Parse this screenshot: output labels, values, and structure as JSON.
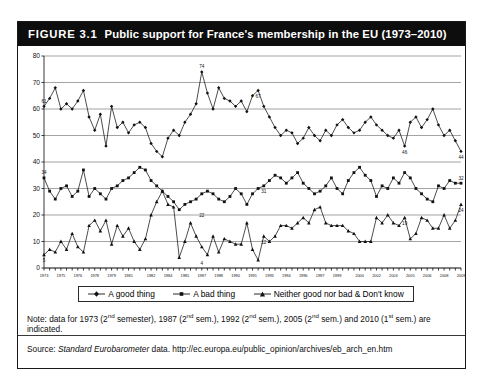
{
  "figure": {
    "number": "FIGURE 3.1",
    "title": "Public support for France's membership in the EU (1973–2010)"
  },
  "note": {
    "prefix": "Note: data for 1973 (2",
    "full": "Note: data for 1973 (2nd semester), 1987 (2nd sem.), 1992 (2nd sem.), 2005 (2nd sem.) and 2010 (1st sem.) are indicated."
  },
  "source": {
    "label": "Source:",
    "italic": "Standard Eurobarometer",
    "rest": "data.",
    "url": "http://ec.europa.eu/public_opinion/archives/eb_arch_en.htm"
  },
  "legend": {
    "items": [
      {
        "label": "A good thing",
        "marker": "line-diamond"
      },
      {
        "label": "A bad thing",
        "marker": "line-square"
      },
      {
        "label": "Neither good nor bad & Don't know",
        "marker": "line-triangle"
      }
    ]
  },
  "chart_data": {
    "type": "line",
    "title": "Public support for France's membership in the EU (1973–2010)",
    "xlabel": "",
    "ylabel": "",
    "ylim": [
      0,
      80
    ],
    "yticks": [
      0,
      10,
      20,
      30,
      40,
      50,
      60,
      70,
      80
    ],
    "grid": true,
    "legend_position": "bottom",
    "x_tick_labels": [
      "1973",
      "1975",
      "1976",
      "1978",
      "1979",
      "1981",
      "1982",
      "1984",
      "1985",
      "1987",
      "1988",
      "1990",
      "1991",
      "1993",
      "1994",
      "1996",
      "1997",
      "1999",
      "2000",
      "2002",
      "2003",
      "2005",
      "2006",
      "2008",
      "2009"
    ],
    "annotations": [
      {
        "series": "A good thing",
        "index": 0,
        "value": 61,
        "text": "61"
      },
      {
        "series": "A good thing",
        "index": 28,
        "value": 74,
        "text": "74"
      },
      {
        "series": "A good thing",
        "index": 38,
        "value": 67,
        "text": "67"
      },
      {
        "series": "A good thing",
        "index": 64,
        "value": 46,
        "text": "46"
      },
      {
        "series": "A good thing",
        "index": 74,
        "value": 44,
        "text": "44"
      },
      {
        "series": "A bad thing",
        "index": 0,
        "value": 34,
        "text": "34"
      },
      {
        "series": "A bad thing",
        "index": 28,
        "value": 22,
        "text": "22"
      },
      {
        "series": "A bad thing",
        "index": 39,
        "value": 31,
        "text": "31"
      },
      {
        "series": "A bad thing",
        "index": 74,
        "value": 32,
        "text": "32"
      },
      {
        "series": "Neither good nor bad & Don't know",
        "index": 0,
        "value": 5,
        "text": "5"
      },
      {
        "series": "Neither good nor bad & Don't know",
        "index": 28,
        "value": 4,
        "text": "4"
      },
      {
        "series": "Neither good nor bad & Don't know",
        "index": 39,
        "value": 12,
        "text": "12"
      },
      {
        "series": "Neither good nor bad & Don't know",
        "index": 64,
        "value": 19,
        "text": "19"
      },
      {
        "series": "Neither good nor bad & Don't know",
        "index": 74,
        "value": 24,
        "text": "24"
      }
    ],
    "series": [
      {
        "name": "A good thing",
        "marker": "diamond",
        "values": [
          61,
          64,
          68,
          60,
          62,
          60,
          63,
          67,
          57,
          52,
          58,
          46,
          61,
          53,
          55,
          51,
          54,
          55,
          53,
          47,
          44,
          42,
          49,
          52,
          50,
          55,
          58,
          62,
          74,
          66,
          60,
          68,
          64,
          63,
          61,
          63,
          59,
          65,
          67,
          61,
          57,
          53,
          50,
          52,
          51,
          47,
          49,
          53,
          50,
          48,
          52,
          50,
          54,
          56,
          53,
          51,
          52,
          55,
          57,
          54,
          52,
          50,
          49,
          52,
          46,
          55,
          57,
          53,
          56,
          60,
          54,
          50,
          52,
          48,
          44
        ]
      },
      {
        "name": "A bad thing",
        "marker": "square",
        "values": [
          34,
          29,
          26,
          30,
          31,
          27,
          29,
          37,
          27,
          30,
          28,
          26,
          30,
          31,
          33,
          34,
          36,
          38,
          37,
          33,
          31,
          29,
          27,
          25,
          22,
          24,
          25,
          26,
          28,
          29,
          28,
          26,
          25,
          27,
          30,
          28,
          24,
          28,
          30,
          31,
          33,
          35,
          34,
          32,
          34,
          36,
          32,
          30,
          28,
          29,
          31,
          34,
          30,
          28,
          33,
          36,
          38,
          35,
          33,
          27,
          31,
          30,
          34,
          32,
          36,
          34,
          30,
          28,
          26,
          25,
          31,
          30,
          33,
          32,
          32
        ]
      },
      {
        "name": "Neither good nor bad & Don't know",
        "marker": "triangle",
        "values": [
          5,
          7,
          6,
          10,
          7,
          13,
          8,
          6,
          16,
          18,
          14,
          18,
          9,
          16,
          12,
          15,
          10,
          7,
          11,
          20,
          25,
          29,
          24,
          23,
          4,
          10,
          17,
          12,
          8,
          5,
          12,
          6,
          11,
          10,
          9,
          9,
          17,
          7,
          3,
          12,
          10,
          12,
          16,
          16,
          15,
          17,
          19,
          17,
          22,
          23,
          17,
          16,
          16,
          16,
          14,
          13,
          10,
          10,
          10,
          19,
          17,
          20,
          17,
          16,
          19,
          11,
          13,
          19,
          18,
          15,
          15,
          20,
          15,
          18,
          24
        ]
      }
    ]
  }
}
